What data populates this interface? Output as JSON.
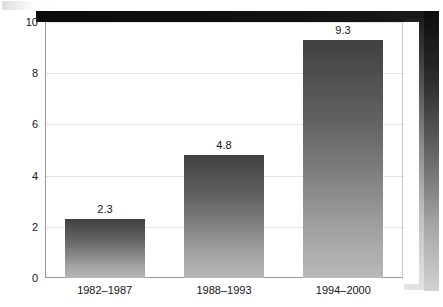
{
  "chart_data": {
    "type": "bar",
    "title": "",
    "subtitle": "",
    "xlabel": "",
    "ylabel": "",
    "categories": [
      "1982–1987",
      "1988–1993",
      "1994–2000"
    ],
    "values": [
      2.3,
      4.8,
      9.3
    ],
    "value_labels": [
      "2.3",
      "4.8",
      "9.3"
    ],
    "ylim": [
      0,
      10
    ],
    "ytick_labels": [
      "0",
      "2",
      "4",
      "6",
      "8",
      "10"
    ],
    "ytick_values": [
      0,
      2,
      4,
      6,
      8,
      10
    ],
    "grid": true,
    "legend": false,
    "legend_position": "none",
    "bar_color_top": "#404040",
    "bar_color_bottom": "#b8b8b8",
    "gridline_color": "#e3e3e3",
    "axis_color": "#9a9a9a",
    "text_color": "#141414",
    "background_color": "#ffffff"
  }
}
